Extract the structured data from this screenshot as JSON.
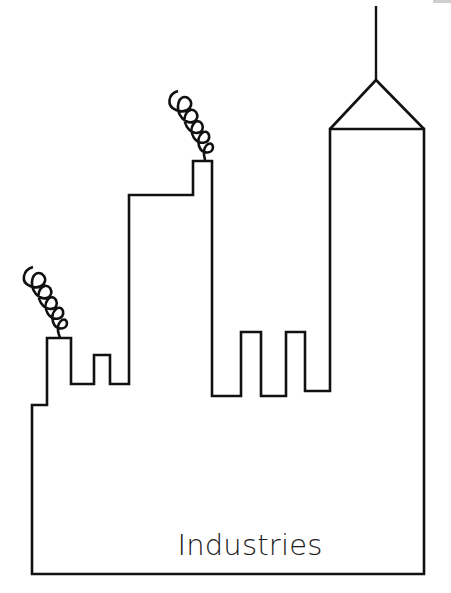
{
  "diagram": {
    "title": "Industries",
    "colors": {
      "line": "#111111",
      "background": "#ffffff",
      "label": "#1a1a1a"
    },
    "elements": [
      {
        "name": "factory-building-left",
        "smoke": true
      },
      {
        "name": "small-chimney-left",
        "smoke": false
      },
      {
        "name": "tall-factory-center",
        "smoke": true
      },
      {
        "name": "crenellation-1",
        "smoke": false
      },
      {
        "name": "crenellation-2",
        "smoke": false
      },
      {
        "name": "skyscraper-right",
        "spire": true
      }
    ]
  }
}
